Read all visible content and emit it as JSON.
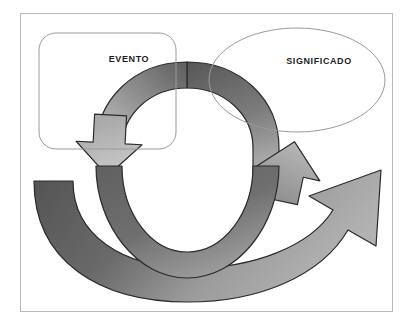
{
  "diagram": {
    "type": "cycle-diagram",
    "background_color": "#ffffff",
    "frame": {
      "border_color": "#b9b9b9",
      "fill": "#ffffff"
    },
    "nodes": [
      {
        "id": "evento",
        "label": "EVENTO",
        "shape": "rounded-rectangle",
        "stroke_color": "#9a9a9a",
        "fill": "#ffffff"
      },
      {
        "id": "significado",
        "label": "SIGNIFICADO",
        "shape": "ellipse",
        "stroke_color": "#9a9a9a",
        "fill": "#ffffff"
      }
    ],
    "arrows": [
      {
        "id": "inner-arrow-top",
        "direction": "clockwise-to-evento",
        "head": "down-left",
        "fill_light": "#c0c0c0",
        "fill_dark": "#5e5e5e",
        "stroke_color": "#2b2b2b"
      },
      {
        "id": "inner-arrow-bottom",
        "direction": "clockwise-to-significado",
        "head": "up",
        "fill_light": "#b0b0b0",
        "fill_dark": "#5a5a5a",
        "stroke_color": "#2b2b2b"
      },
      {
        "id": "outer-arrow",
        "direction": "left-to-right-sweep",
        "head": "up-right",
        "fill_light": "#a8a8a8",
        "fill_dark": "#575757",
        "stroke_color": "#2b2b2b"
      }
    ],
    "colors": {
      "dark_gray": "#575757",
      "mid_gray": "#8f8f8f",
      "light_gray": "#c0c0c0",
      "outline": "#2b2b2b",
      "text": "#1d1d1d"
    }
  }
}
